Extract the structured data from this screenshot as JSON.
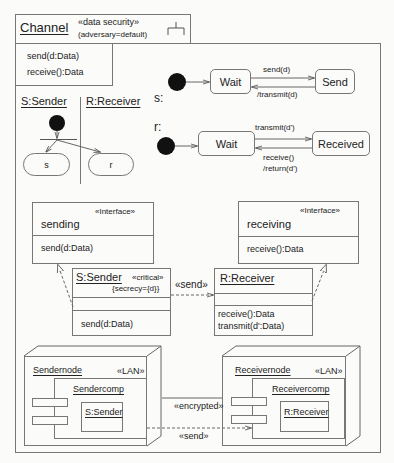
{
  "channel": {
    "name": "Channel",
    "stereotype": "«data security»",
    "tag": "(adversary=default)",
    "icon": "subsystem-fork-icon",
    "operations": [
      "send(d:Data)",
      "receive():Data"
    ]
  },
  "activity": {
    "lanes": [
      "S:Sender",
      "R:Receiver"
    ],
    "states": [
      "s",
      "r"
    ]
  },
  "statemachine_s": {
    "label": "s:",
    "states": [
      "Wait",
      "Send"
    ],
    "transitions": {
      "forward": "send(d)",
      "back": "/transmit(d)"
    }
  },
  "statemachine_r": {
    "label": "r:",
    "states": [
      "Wait",
      "Received"
    ],
    "transitions": {
      "forward": "transmit(d')",
      "back_line1": "receive()",
      "back_line2": "/return(d')"
    }
  },
  "interfaces": {
    "sending": {
      "stereotype": "«Interface»",
      "name": "sending",
      "operation": "send(d:Data)"
    },
    "receiving": {
      "stereotype": "«Interface»",
      "name": "receiving",
      "operation": "receive():Data"
    }
  },
  "classes": {
    "sender": {
      "name": "S:Sender",
      "stereotype": "«critical»",
      "tag": "{secrecy={d}}",
      "operations": [
        "send(d:Data)"
      ]
    },
    "receiver": {
      "name": "R:Receiver",
      "operations": [
        "receive():Data",
        "transmit(d':Data)"
      ]
    },
    "dependency_label": "«send»"
  },
  "deployment": {
    "sendernode": {
      "name": "Sendernode",
      "stereotype": "«LAN»",
      "component": "Sendercomp",
      "object": "S:Sender"
    },
    "receivernode": {
      "name": "Receivernode",
      "stereotype": "«LAN»",
      "component": "Receivercomp",
      "object": "R:Receiver"
    },
    "link_label": "«encrypted»",
    "dependency_label": "«send»"
  }
}
